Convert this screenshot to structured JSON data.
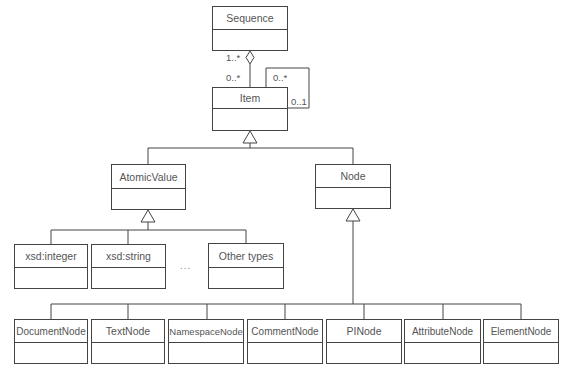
{
  "diagram": {
    "type": "UML class diagram",
    "classes": {
      "sequence": "Sequence",
      "item": "Item",
      "atomic_value": "AtomicValue",
      "node": "Node",
      "xsd_integer": "xsd:integer",
      "xsd_string": "xsd:string",
      "other_types": "Other types",
      "document_node": "DocumentNode",
      "text_node": "TextNode",
      "namespace_node": "NamespaceNode",
      "comment_node": "CommentNode",
      "pi_node": "PINode",
      "attribute_node": "AttributeNode",
      "element_node": "ElementNode"
    },
    "multiplicities": {
      "sequence_side": "1..*",
      "item_side": "0..*",
      "self_top": "0..*",
      "self_right": "0..1"
    },
    "ellipsis": "...",
    "relationships": [
      {
        "from": "Sequence",
        "to": "Item",
        "kind": "aggregation",
        "mult_from": "1..*",
        "mult_to": "0..*"
      },
      {
        "from": "Item",
        "to": "Item",
        "kind": "association",
        "mult_a": "0..*",
        "mult_b": "0..1"
      },
      {
        "from": "AtomicValue",
        "to": "Item",
        "kind": "generalization"
      },
      {
        "from": "Node",
        "to": "Item",
        "kind": "generalization"
      },
      {
        "from": "xsd:integer",
        "to": "AtomicValue",
        "kind": "generalization"
      },
      {
        "from": "xsd:string",
        "to": "AtomicValue",
        "kind": "generalization"
      },
      {
        "from": "Other types",
        "to": "AtomicValue",
        "kind": "generalization"
      },
      {
        "from": "DocumentNode",
        "to": "Node",
        "kind": "generalization"
      },
      {
        "from": "TextNode",
        "to": "Node",
        "kind": "generalization"
      },
      {
        "from": "NamespaceNode",
        "to": "Node",
        "kind": "generalization"
      },
      {
        "from": "CommentNode",
        "to": "Node",
        "kind": "generalization"
      },
      {
        "from": "PINode",
        "to": "Node",
        "kind": "generalization"
      },
      {
        "from": "AttributeNode",
        "to": "Node",
        "kind": "generalization"
      },
      {
        "from": "ElementNode",
        "to": "Node",
        "kind": "generalization"
      }
    ]
  }
}
